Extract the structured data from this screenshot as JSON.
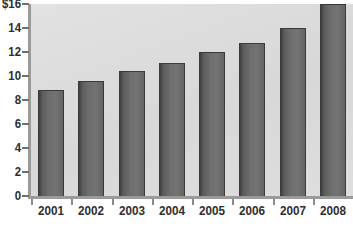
{
  "chart_data": {
    "type": "bar",
    "title": "",
    "xlabel": "",
    "ylabel": "",
    "categories": [
      "2001",
      "2002",
      "2003",
      "2004",
      "2005",
      "2006",
      "2007",
      "2008"
    ],
    "values": [
      8.8,
      9.6,
      10.4,
      11.1,
      12.0,
      12.75,
      14.0,
      16.0
    ],
    "ylim": [
      0,
      16
    ],
    "ytick_values": [
      0,
      2,
      4,
      6,
      8,
      10,
      12,
      14,
      16
    ],
    "ytick_labels": [
      "0",
      "2",
      "4",
      "6",
      "8",
      "10",
      "12",
      "14",
      "$16"
    ],
    "currency_symbol": "$",
    "grid": false,
    "legend": null,
    "legend_position": "none",
    "orientation": "vertical",
    "series": [
      {
        "name": "value",
        "values": [
          8.8,
          9.6,
          10.4,
          11.1,
          12.0,
          12.75,
          14.0,
          16.0
        ]
      }
    ]
  },
  "style": {
    "plot_background": "#dcdcdc",
    "page_background": "#ffffff",
    "bar_fill_dark": "#3f3f3f",
    "bar_fill_light": "#737373",
    "bar_outline": "#3a3a3a",
    "axis_color": "#9a9a9a",
    "tick_color": "#6f6f6f",
    "label_color": "#2e2e2e"
  }
}
